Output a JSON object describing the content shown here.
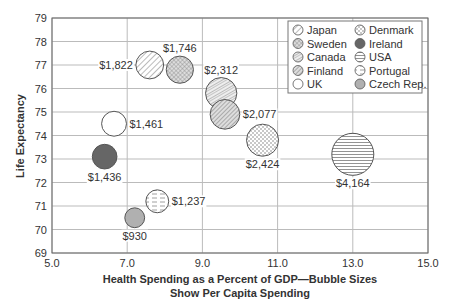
{
  "chart_data": {
    "type": "scatter",
    "subtype": "bubble",
    "title": "",
    "xlabel": "Health Spending as a Percent of GDP—Bubble Sizes",
    "xlabel_line2": "Show Per Capita Spending",
    "ylabel": "Life Expectancy",
    "xlim": [
      5.0,
      15.0
    ],
    "ylim": [
      69,
      79
    ],
    "xticks": [
      "5.0",
      "7.0",
      "9.0",
      "11.0",
      "13.0",
      "15.0"
    ],
    "xtick_values": [
      5,
      7,
      9,
      11,
      13,
      15
    ],
    "yticks": [
      "69",
      "70",
      "71",
      "72",
      "73",
      "74",
      "75",
      "76",
      "77",
      "78",
      "79"
    ],
    "ytick_values": [
      69,
      70,
      71,
      72,
      73,
      74,
      75,
      76,
      77,
      78,
      79
    ],
    "grid": true,
    "legend_position": "top-right",
    "series": [
      {
        "name": "Japan",
        "x": 7.6,
        "y": 77.0,
        "size": 1822,
        "label": "$1,822",
        "label_pos": "left",
        "pattern": "diag"
      },
      {
        "name": "Sweden",
        "x": 8.4,
        "y": 76.8,
        "size": 1746,
        "label": "$1,746",
        "label_pos": "top",
        "pattern": "cross"
      },
      {
        "name": "Canada",
        "x": 9.5,
        "y": 75.8,
        "size": 2312,
        "label": "$2,312",
        "label_pos": "top",
        "pattern": "mixed"
      },
      {
        "name": "Finland",
        "x": 9.6,
        "y": 74.9,
        "size": 2077,
        "label": "$2,077",
        "label_pos": "right",
        "pattern": "diagdense"
      },
      {
        "name": "UK",
        "x": 6.65,
        "y": 74.5,
        "size": 1461,
        "label": "$1,461",
        "label_pos": "right",
        "pattern": "none"
      },
      {
        "name": "Denmark",
        "x": 10.6,
        "y": 73.8,
        "size": 2424,
        "label": "$2,424",
        "label_pos": "bottom",
        "pattern": "dots"
      },
      {
        "name": "Ireland",
        "x": 6.4,
        "y": 73.1,
        "size": 1436,
        "label": "$1,436",
        "label_pos": "bottom",
        "pattern": "dark"
      },
      {
        "name": "USA",
        "x": 13.0,
        "y": 73.2,
        "size": 4164,
        "label": "$4,164",
        "label_pos": "bottom",
        "pattern": "hlines"
      },
      {
        "name": "Portugal",
        "x": 7.8,
        "y": 71.2,
        "size": 1237,
        "label": "$1,237",
        "label_pos": "right",
        "pattern": "dashes"
      },
      {
        "name": "Czech Rep.",
        "x": 7.2,
        "y": 70.5,
        "size": 930,
        "label": "$930",
        "label_pos": "bottom",
        "pattern": "gray"
      }
    ],
    "legend": [
      {
        "name": "Japan",
        "pattern": "diag"
      },
      {
        "name": "Sweden",
        "pattern": "cross"
      },
      {
        "name": "Canada",
        "pattern": "mixed"
      },
      {
        "name": "Finland",
        "pattern": "diagdense"
      },
      {
        "name": "UK",
        "pattern": "none"
      },
      {
        "name": "Denmark",
        "pattern": "dots"
      },
      {
        "name": "Ireland",
        "pattern": "dark"
      },
      {
        "name": "USA",
        "pattern": "hlines"
      },
      {
        "name": "Portugal",
        "pattern": "dashes"
      },
      {
        "name": "Czech Rep.",
        "pattern": "gray"
      }
    ],
    "colors": {
      "stroke": "#555555",
      "dark_fill": "#666666",
      "gray_fill": "#b0b0b0",
      "grid": "#bbbbbb",
      "axis": "#555555"
    }
  }
}
